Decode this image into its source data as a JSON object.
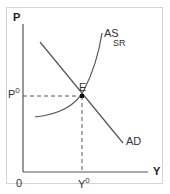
{
  "diagram": {
    "type": "AD-AS short-run equilibrium",
    "axes": {
      "y_label": "P",
      "x_label": "Y",
      "origin_label": "0"
    },
    "curves": [
      {
        "name": "AD",
        "label": "AD",
        "shape": "downward sloping line"
      },
      {
        "name": "AS_SR",
        "label": "AS",
        "sub_label": "SR",
        "shape": "upward sloping convex curve"
      }
    ],
    "equilibrium": {
      "point_label": "E",
      "price_label": "P",
      "price_sup": "0",
      "output_label": "Y",
      "output_sup": "0"
    },
    "colors": {
      "line": "#555555",
      "point": "#111111",
      "frame": "#d4d4d4",
      "text": "#333333"
    }
  }
}
